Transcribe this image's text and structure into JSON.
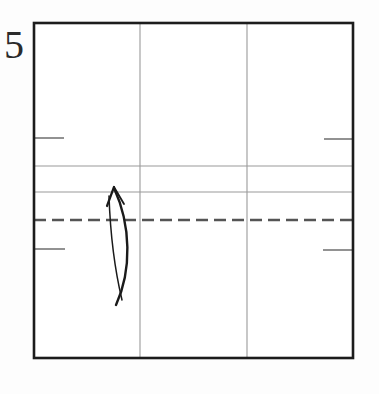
{
  "diagram": {
    "kind": "origami-step-diagram",
    "step_number": "5",
    "background_color": "#fdfdfd",
    "canvas": {
      "width": 379,
      "height": 394
    },
    "paper": {
      "name": "square-paper",
      "left": 34,
      "top": 23,
      "right": 353,
      "bottom": 358,
      "edge_color": "#1c1c1c",
      "edge_width": 2.6,
      "fill_color": "#ffffff"
    },
    "crease_lines": {
      "existing_color": "#9a9a9a",
      "existing_width": 1.1,
      "vertical": [
        {
          "name": "vertical-crease-left-third",
          "x": 140,
          "y1": 23,
          "y2": 358
        },
        {
          "name": "vertical-crease-right-third",
          "x": 247,
          "y1": 23,
          "y2": 358
        }
      ],
      "horizontal": [
        {
          "name": "horizontal-crease-upper",
          "y": 166,
          "x1": 34,
          "x2": 353
        },
        {
          "name": "horizontal-crease-lower",
          "y": 192,
          "x1": 34,
          "x2": 353
        }
      ]
    },
    "tick_marks": {
      "color": "#777777",
      "width": 1.6,
      "items": [
        {
          "name": "tick-top-left",
          "x1": 34,
          "x2": 64,
          "y": 138
        },
        {
          "name": "tick-top-right",
          "x1": 324,
          "x2": 353,
          "y": 139
        },
        {
          "name": "tick-bottom-left",
          "x1": 34,
          "x2": 65,
          "y": 249
        },
        {
          "name": "tick-bottom-right",
          "x1": 323,
          "x2": 353,
          "y": 250
        }
      ]
    },
    "fold_line": {
      "name": "valley-fold-dashed-line",
      "style": "dashed",
      "y": 220,
      "x1": 34,
      "x2": 353,
      "color": "#555555",
      "width": 2.6,
      "dash_length": 12,
      "gap_length": 6
    },
    "fold_arrow": {
      "name": "fold-direction-arrow",
      "direction": "upward-curved",
      "color": "#1a1a1a",
      "tip": {
        "x": 115,
        "y": 186
      },
      "tail": {
        "x": 116,
        "y": 305
      },
      "outer_path": "M 116 305 C 132 270, 131 225, 114 188",
      "inner_path": "M 122 300 C 112 258, 110 225, 109 196",
      "arrowhead_left": "M 114 187 L 107 206",
      "arrowhead_right": "M 114 187 L 124 204"
    }
  }
}
